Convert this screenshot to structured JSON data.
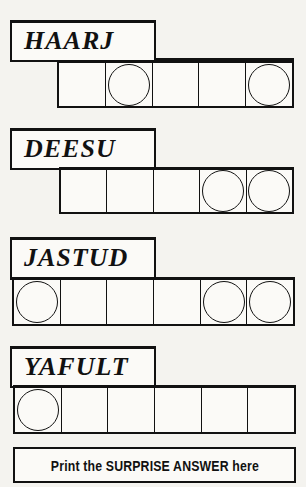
{
  "puzzles": [
    {
      "jumble": "HAARJ",
      "cells": 5,
      "circled": [
        false,
        true,
        false,
        false,
        true
      ]
    },
    {
      "jumble": "DEESU",
      "cells": 5,
      "circled": [
        false,
        false,
        false,
        true,
        true
      ]
    },
    {
      "jumble": "JASTUD",
      "cells": 6,
      "circled": [
        true,
        false,
        false,
        false,
        true,
        true
      ]
    },
    {
      "jumble": "YAFULT",
      "cells": 6,
      "circled": [
        true,
        false,
        false,
        false,
        false,
        false
      ]
    }
  ],
  "answer": {
    "label": "Print the SURPRISE ANSWER here"
  }
}
